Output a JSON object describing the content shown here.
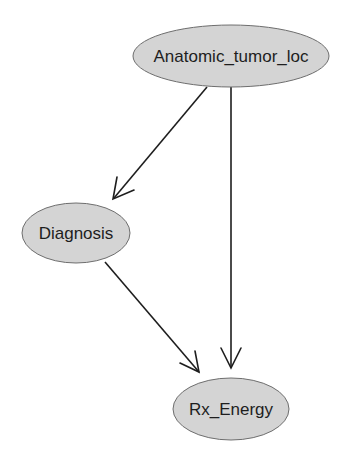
{
  "diagram": {
    "type": "directed-graph",
    "colors": {
      "node_fill": "#d4d4d4",
      "node_stroke": "#6e6e6e",
      "edge": "#1e1e1e",
      "text": "#1e1e1e"
    },
    "nodes": [
      {
        "id": "anatomic",
        "label": "Anatomic_tumor_loc"
      },
      {
        "id": "diagnosis",
        "label": "Diagnosis"
      },
      {
        "id": "rx_energy",
        "label": "Rx_Energy"
      }
    ],
    "edges": [
      {
        "from": "Anatomic_tumor_loc",
        "to": "Diagnosis"
      },
      {
        "from": "Anatomic_tumor_loc",
        "to": "Rx_Energy"
      },
      {
        "from": "Diagnosis",
        "to": "Rx_Energy"
      }
    ]
  }
}
